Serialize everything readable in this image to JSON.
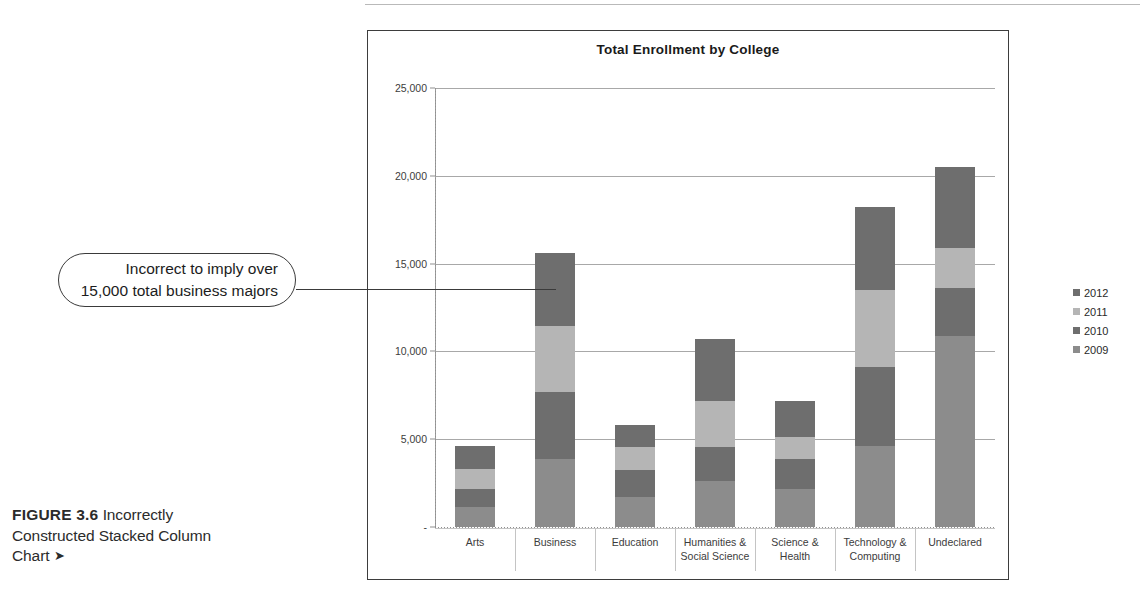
{
  "figure": {
    "label": "FIGURE 3.6",
    "caption": "Incorrectly Constructed Stacked Column Chart",
    "arrow": "➤"
  },
  "callout": {
    "line1": "Incorrect to imply over",
    "line2": "15,000 total business majors"
  },
  "chart_data": {
    "type": "bar",
    "subtype": "stacked-column",
    "title": "Total Enrollment by College",
    "xlabel": "",
    "ylabel": "",
    "ylim": [
      0,
      25000
    ],
    "grid": true,
    "legend_position": "right",
    "y_ticks": [
      {
        "value": 25000,
        "label": "25,000"
      },
      {
        "value": 20000,
        "label": "20,000"
      },
      {
        "value": 15000,
        "label": "15,000"
      },
      {
        "value": 10000,
        "label": "10,000"
      },
      {
        "value": 5000,
        "label": "5,000"
      },
      {
        "value": 0,
        "label": "-"
      }
    ],
    "categories": [
      "Arts",
      "Business",
      "Education",
      "Humanities & Social Science",
      "Science & Health",
      "Technology & Computing",
      "Undeclared"
    ],
    "category_lines": [
      [
        "Arts"
      ],
      [
        "Business"
      ],
      [
        "Education"
      ],
      [
        "Humanities &",
        "Social Science"
      ],
      [
        "Science &",
        "Health"
      ],
      [
        "Technology &",
        "Computing"
      ],
      [
        "Undeclared"
      ]
    ],
    "series": [
      {
        "name": "2009",
        "color": "#8c8c8c",
        "values": [
          1150,
          3850,
          1700,
          2600,
          2150,
          4600,
          10900
        ]
      },
      {
        "name": "2010",
        "color": "#6e6e6e",
        "values": [
          1000,
          3850,
          1550,
          1950,
          1750,
          4500,
          2700
        ]
      },
      {
        "name": "2011",
        "color": "#b5b5b5",
        "values": [
          1150,
          3750,
          1300,
          2600,
          1250,
          4400,
          2300
        ]
      },
      {
        "name": "2012",
        "color": "#6e6e6e",
        "values": [
          1300,
          4150,
          1250,
          3550,
          2050,
          4700,
          4600
        ]
      }
    ],
    "totals": [
      4600,
      15600,
      5800,
      10700,
      7200,
      18200,
      20500
    ]
  }
}
